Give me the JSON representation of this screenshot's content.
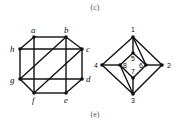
{
  "captions": {
    "top": "(c)",
    "bottom": "(e)"
  },
  "graph_left": {
    "nodes": [
      {
        "id": "a",
        "label": "a",
        "x": 34,
        "y": 37,
        "lx": 31,
        "ly": 33
      },
      {
        "id": "b",
        "label": "b",
        "x": 66,
        "y": 37,
        "lx": 64,
        "ly": 33
      },
      {
        "id": "c",
        "label": "c",
        "x": 82,
        "y": 49,
        "lx": 86,
        "ly": 52
      },
      {
        "id": "d",
        "label": "d",
        "x": 82,
        "y": 79,
        "lx": 86,
        "ly": 82
      },
      {
        "id": "e",
        "label": "e",
        "x": 66,
        "y": 93,
        "lx": 64,
        "ly": 103
      },
      {
        "id": "f",
        "label": "f",
        "x": 34,
        "y": 93,
        "lx": 32,
        "ly": 103
      },
      {
        "id": "g",
        "label": "g",
        "x": 20,
        "y": 79,
        "lx": 10,
        "ly": 83
      },
      {
        "id": "h",
        "label": "h",
        "x": 20,
        "y": 49,
        "lx": 10,
        "ly": 52
      }
    ],
    "edges": [
      [
        "a",
        "b"
      ],
      [
        "b",
        "c"
      ],
      [
        "c",
        "d"
      ],
      [
        "d",
        "e"
      ],
      [
        "e",
        "f"
      ],
      [
        "f",
        "g"
      ],
      [
        "g",
        "h"
      ],
      [
        "h",
        "a"
      ],
      [
        "h",
        "c"
      ],
      [
        "g",
        "d"
      ],
      [
        "a",
        "f"
      ],
      [
        "b",
        "e"
      ],
      [
        "g",
        "b"
      ],
      [
        "f",
        "c"
      ]
    ]
  },
  "graph_right": {
    "nodes": [
      {
        "id": "1",
        "label": "1",
        "x": 133,
        "y": 37,
        "lx": 131,
        "ly": 32
      },
      {
        "id": "2",
        "label": "2",
        "x": 162,
        "y": 65,
        "lx": 167,
        "ly": 68
      },
      {
        "id": "3",
        "label": "3",
        "x": 133,
        "y": 94,
        "lx": 131,
        "ly": 103
      },
      {
        "id": "4",
        "label": "4",
        "x": 102,
        "y": 65,
        "lx": 94,
        "ly": 68
      },
      {
        "id": "5",
        "label": "5",
        "x": 133,
        "y": 53,
        "lx": 131,
        "ly": 61
      },
      {
        "id": "6",
        "label": "6",
        "x": 146,
        "y": 65,
        "lx": 139,
        "ly": 68
      },
      {
        "id": "7",
        "label": "7",
        "x": 133,
        "y": 78,
        "lx": 131,
        "ly": 74
      },
      {
        "id": "8",
        "label": "8",
        "x": 120,
        "y": 65,
        "lx": 123,
        "ly": 68
      }
    ],
    "edges": [
      [
        "1",
        "2"
      ],
      [
        "2",
        "3"
      ],
      [
        "3",
        "4"
      ],
      [
        "4",
        "1"
      ],
      [
        "5",
        "6"
      ],
      [
        "6",
        "7"
      ],
      [
        "7",
        "8"
      ],
      [
        "8",
        "5"
      ],
      [
        "1",
        "5"
      ],
      [
        "3",
        "7"
      ],
      [
        "4",
        "8"
      ],
      [
        "2",
        "6"
      ],
      [
        "1",
        "6"
      ],
      [
        "3",
        "8"
      ]
    ]
  }
}
